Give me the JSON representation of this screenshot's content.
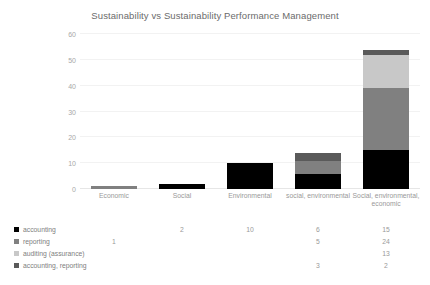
{
  "chart_data": {
    "type": "bar",
    "subtype": "stacked-column-with-data-table",
    "title": "Sustainability vs Sustainability Performance Management",
    "xlabel": "",
    "ylabel": "",
    "ylim": [
      0,
      60
    ],
    "yticks": [
      0,
      10,
      20,
      30,
      40,
      50,
      60
    ],
    "grid": true,
    "legend_position": "bottom-left-data-table",
    "categories": [
      "Economic",
      "Social",
      "Environmental",
      "social, environmental",
      "Social, environmental, economic"
    ],
    "series": [
      {
        "name": "accounting",
        "color": "#000000",
        "values": [
          null,
          2,
          10,
          6,
          15
        ],
        "labels": [
          "",
          "2",
          "10",
          "6",
          "15"
        ]
      },
      {
        "name": "reporting",
        "color": "#808080",
        "values": [
          1,
          null,
          null,
          5,
          24
        ],
        "labels": [
          "1",
          "",
          "",
          "5",
          "24"
        ]
      },
      {
        "name": "auditing (assurance)",
        "color": "#c8c8c8",
        "values": [
          null,
          null,
          null,
          null,
          13
        ],
        "labels": [
          "",
          "",
          "",
          "",
          "13"
        ]
      },
      {
        "name": "accounting, reporting",
        "color": "#5a5a5a",
        "values": [
          null,
          null,
          null,
          3,
          2
        ],
        "labels": [
          "",
          "",
          "",
          "3",
          "2"
        ]
      }
    ],
    "totals": [
      1,
      2,
      10,
      14,
      54
    ]
  },
  "axis": {
    "y_tick_labels": [
      "60",
      "50",
      "40",
      "30",
      "20",
      "10",
      "0"
    ]
  },
  "colors": {
    "accounting": "#000000",
    "reporting": "#808080",
    "auditing": "#c8c8c8",
    "accounting_reporting": "#5a5a5a",
    "gridline": "#f2f2f2",
    "text": "#808080",
    "background": "#ffffff"
  }
}
